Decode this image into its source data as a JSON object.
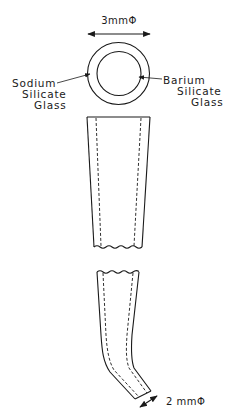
{
  "figure": {
    "top_dimension": "3mmΦ",
    "bottom_dimension": "2 mmΦ",
    "labels": {
      "outer_layer": {
        "line1": "Sodium",
        "line2": "Silicate",
        "line3": "Glass"
      },
      "inner_layer": {
        "line1": "Barium",
        "line2": "Silicate",
        "line3": "Glass"
      }
    },
    "colors": {
      "ink": "#1a1a1a",
      "background": "#ffffff"
    }
  }
}
